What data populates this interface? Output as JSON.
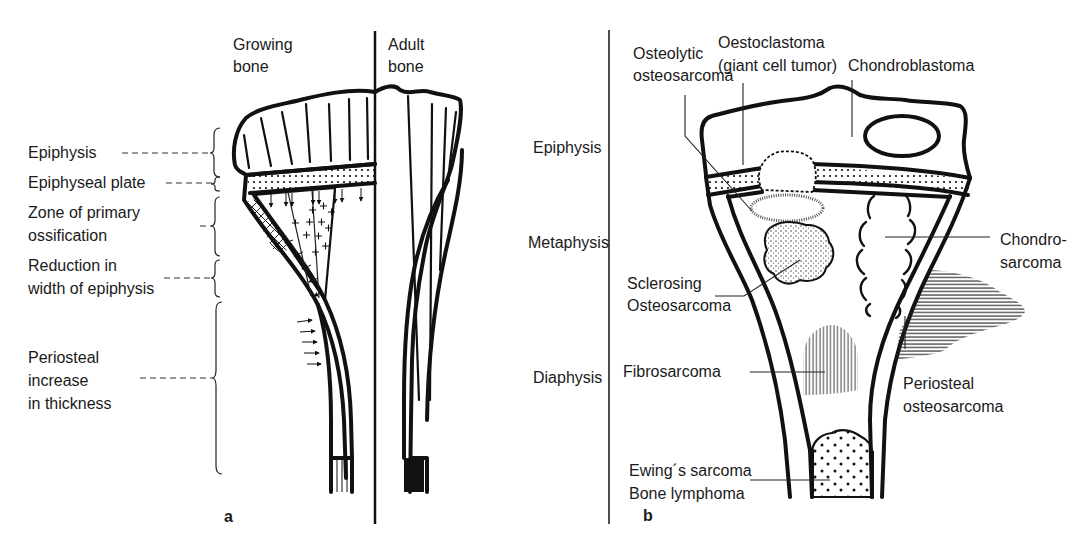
{
  "figure": {
    "panel_a": {
      "panel_label": "a",
      "column_headers": {
        "growing": [
          "Growing",
          "bone"
        ],
        "adult": [
          "Adult",
          "bone"
        ]
      },
      "zone_labels": [
        {
          "id": "epiphysis",
          "lines": [
            "Epiphysis"
          ]
        },
        {
          "id": "epiphyseal-plate",
          "lines": [
            "Epiphyseal plate"
          ]
        },
        {
          "id": "primary-ossification",
          "lines": [
            "Zone of primary",
            "ossification"
          ]
        },
        {
          "id": "reduction-width",
          "lines": [
            "Reduction in",
            "width of epiphysis"
          ]
        },
        {
          "id": "periosteal-increase",
          "lines": [
            "Periosteal",
            "increase",
            "in thickness"
          ]
        }
      ]
    },
    "region_labels": [
      "Epiphysis",
      "Metaphysis",
      "Diaphysis"
    ],
    "panel_b": {
      "panel_label": "b",
      "tumor_labels": [
        {
          "id": "osteolytic-osteosarcoma",
          "lines": [
            "Osteolytic",
            "osteosarcoma"
          ]
        },
        {
          "id": "osteoclastoma",
          "lines": [
            "Oestoclastoma",
            "(giant cell tumor)"
          ]
        },
        {
          "id": "chondroblastoma",
          "lines": [
            "Chondroblastoma"
          ]
        },
        {
          "id": "chondrosarcoma",
          "lines": [
            "Chondro-",
            "sarcoma"
          ]
        },
        {
          "id": "sclerosing-osteosarcoma",
          "lines": [
            "Sclerosing",
            "Osteosarcoma"
          ]
        },
        {
          "id": "fibrosarcoma",
          "lines": [
            "Fibrosarcoma"
          ]
        },
        {
          "id": "periosteal-osteosarcoma",
          "lines": [
            "Periosteal",
            "osteosarcoma"
          ]
        },
        {
          "id": "ewing-lymphoma",
          "lines": [
            "Ewing´s sarcoma",
            "Bone lymphoma"
          ]
        }
      ]
    },
    "colors": {
      "ink": "#111111",
      "background": "#ffffff"
    }
  }
}
